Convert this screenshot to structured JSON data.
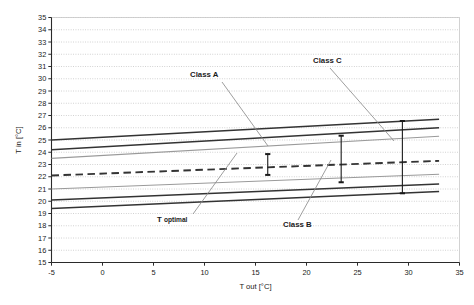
{
  "chart_data": {
    "type": "line",
    "title": "",
    "xlabel": "T out [°C]",
    "ylabel": "T in [°C]",
    "xlim": [
      -5,
      35
    ],
    "ylim": [
      15,
      35
    ],
    "xticks": [
      -5,
      0,
      5,
      10,
      15,
      20,
      25,
      30,
      35
    ],
    "xtick_labels": [
      "-5",
      "0",
      "5",
      "10",
      "15",
      "20",
      "25",
      "30",
      "35"
    ],
    "yticks": [
      15,
      16,
      17,
      18,
      19,
      20,
      21,
      22,
      23,
      24,
      25,
      26,
      27,
      28,
      29,
      30,
      31,
      32,
      33,
      34,
      35
    ],
    "ytick_labels": [
      "15",
      "16",
      "17",
      "18",
      "19",
      "20",
      "21",
      "22",
      "23",
      "24",
      "25",
      "26",
      "27",
      "28",
      "29",
      "30",
      "31",
      "32",
      "33",
      "34",
      "35"
    ],
    "grid": {
      "horizontal": true,
      "vertical": false,
      "style": "dotted",
      "color": "#b9b9b9"
    },
    "legend": {
      "position": "none",
      "entries": []
    },
    "series": [
      {
        "name": "Class C upper limit",
        "style": "solid",
        "color": "#333333",
        "width": 1.5,
        "x": [
          -5,
          33
        ],
        "y": [
          25.0,
          26.7
        ]
      },
      {
        "name": "Class B upper limit",
        "style": "solid",
        "color": "#333333",
        "width": 1.5,
        "x": [
          -5,
          33
        ],
        "y": [
          24.2,
          26.0
        ]
      },
      {
        "name": "Class A upper limit",
        "style": "solid",
        "color": "#9a9a9a",
        "width": 1.1,
        "x": [
          -5,
          33
        ],
        "y": [
          23.5,
          25.3
        ]
      },
      {
        "name": "T optimal",
        "style": "dashed",
        "color": "#333333",
        "width": 1.9,
        "x": [
          -5,
          33
        ],
        "y": [
          22.1,
          23.3
        ]
      },
      {
        "name": "Class A lower limit",
        "style": "solid",
        "color": "#9a9a9a",
        "width": 1.1,
        "x": [
          -5,
          33
        ],
        "y": [
          21.0,
          22.2
        ]
      },
      {
        "name": "Class B lower limit",
        "style": "solid",
        "color": "#333333",
        "width": 1.5,
        "x": [
          -5,
          33
        ],
        "y": [
          20.1,
          21.4
        ]
      },
      {
        "name": "Class C lower limit",
        "style": "solid",
        "color": "#333333",
        "width": 1.5,
        "x": [
          -5,
          33
        ],
        "y": [
          19.4,
          20.8
        ]
      }
    ],
    "range_markers": [
      {
        "name": "Class A range marker",
        "x": 16.2,
        "y_low": 22.15,
        "y_high": 23.85,
        "color": "#1a1a1a"
      },
      {
        "name": "Class B range marker",
        "x": 23.4,
        "y_low": 21.55,
        "y_high": 25.35,
        "color": "#1a1a1a"
      },
      {
        "name": "Class C range marker",
        "x": 29.4,
        "y_low": 20.65,
        "y_high": 26.55,
        "color": "#1a1a1a"
      }
    ],
    "annotations": [
      {
        "name": "Class A",
        "text": "Class A",
        "sub": "",
        "label_x": 190,
        "label_y": 77,
        "leader": [
          [
            222,
            82
          ],
          [
            268,
            146
          ]
        ]
      },
      {
        "name": "Class C",
        "text": "Class C",
        "sub": "",
        "label_x": 313,
        "label_y": 63,
        "leader": [
          [
            330,
            68
          ],
          [
            394,
            141
          ]
        ]
      },
      {
        "name": "T optimal",
        "text": "T",
        "sub": "optimal",
        "label_x": 157,
        "label_y": 222,
        "leader": [
          [
            193,
            214
          ],
          [
            237,
            153
          ]
        ]
      },
      {
        "name": "Class B",
        "text": "Class B",
        "sub": "",
        "label_x": 283,
        "label_y": 227,
        "leader": [
          [
            298,
            220
          ],
          [
            331,
            160
          ]
        ]
      }
    ]
  },
  "axis_titles": {
    "x": "T out [°C]",
    "y": "T in [°C]"
  }
}
